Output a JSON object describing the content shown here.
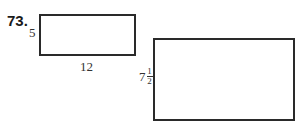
{
  "problem_number": "73.",
  "rectangles": [
    {
      "id": "small",
      "height_label": "5",
      "width_label": "12"
    },
    {
      "id": "large",
      "height_label": {
        "whole": "7",
        "numerator": "1",
        "denominator": "2"
      }
    }
  ]
}
